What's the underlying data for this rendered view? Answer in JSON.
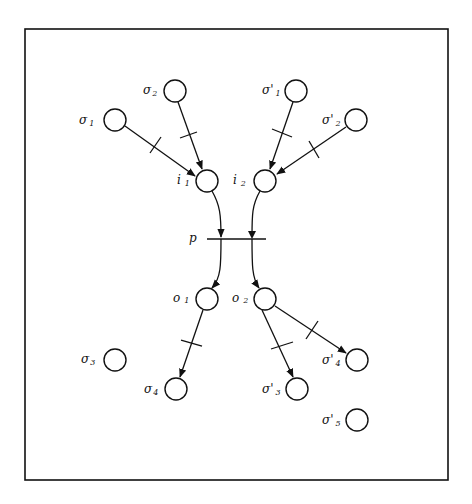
{
  "diagram": {
    "type": "petri-net",
    "frame": {
      "x": 25,
      "y": 29,
      "width": 423,
      "height": 451,
      "color": "#111111"
    },
    "places": [
      {
        "id": "sigma1",
        "label": "σ",
        "sub": "1",
        "cx": 115,
        "cy": 120
      },
      {
        "id": "sigma2",
        "label": "σ",
        "sub": "2",
        "cx": 175,
        "cy": 91
      },
      {
        "id": "sigmap1",
        "label": "σ'",
        "sub": "1",
        "cx": 296,
        "cy": 91
      },
      {
        "id": "sigmap2",
        "label": "σ'",
        "sub": "2",
        "cx": 356,
        "cy": 120
      },
      {
        "id": "i1",
        "label": "i",
        "sub": "1",
        "cx": 207,
        "cy": 181
      },
      {
        "id": "i2",
        "label": "i",
        "sub": "2",
        "cx": 265,
        "cy": 181
      },
      {
        "id": "o1",
        "label": "o",
        "sub": "1",
        "cx": 207,
        "cy": 299
      },
      {
        "id": "o2",
        "label": "o",
        "sub": "2",
        "cx": 265,
        "cy": 299
      },
      {
        "id": "sigma3",
        "label": "σ",
        "sub": "3",
        "cx": 115,
        "cy": 360
      },
      {
        "id": "sigma4",
        "label": "σ",
        "sub": "4",
        "cx": 176,
        "cy": 389
      },
      {
        "id": "sigmap3",
        "label": "σ'",
        "sub": "3",
        "cx": 297,
        "cy": 389
      },
      {
        "id": "sigmap4",
        "label": "σ'",
        "sub": "4",
        "cx": 357,
        "cy": 360
      },
      {
        "id": "sigmap5",
        "label": "σ'",
        "sub": "5",
        "cx": 357,
        "cy": 420
      }
    ],
    "transition": {
      "label": "p",
      "y": 239,
      "x1": 207,
      "x2": 266
    },
    "arcs": [
      {
        "from": "sigma1",
        "to": "i1",
        "has_transition_tick": true
      },
      {
        "from": "sigma2",
        "to": "i1",
        "has_transition_tick": true
      },
      {
        "from": "sigmap1",
        "to": "i2",
        "has_transition_tick": true
      },
      {
        "from": "sigmap2",
        "to": "i2",
        "has_transition_tick": true
      },
      {
        "from": "i1",
        "to": "p",
        "has_transition_tick": false
      },
      {
        "from": "i2",
        "to": "p",
        "has_transition_tick": false
      },
      {
        "from": "p",
        "to": "o1",
        "has_transition_tick": false
      },
      {
        "from": "p",
        "to": "o2",
        "has_transition_tick": false
      },
      {
        "from": "o1",
        "to": "sigma4",
        "has_transition_tick": true
      },
      {
        "from": "o2",
        "to": "sigmap3",
        "has_transition_tick": true
      },
      {
        "from": "o2",
        "to": "sigmap4",
        "has_transition_tick": true
      }
    ],
    "labels": {
      "sigma1": "σ",
      "sigma1_sub": "1",
      "sigma2": "σ",
      "sigma2_sub": "2",
      "sigmap1": "σ'",
      "sigmap1_sub": "1",
      "sigmap2": "σ'",
      "sigmap2_sub": "2",
      "i1": "i",
      "i1_sub": "1",
      "i2": "i",
      "i2_sub": "2",
      "p": "p",
      "o1": "o",
      "o1_sub": "1",
      "o2": "o",
      "o2_sub": "2",
      "sigma3": "σ",
      "sigma3_sub": "3",
      "sigma4": "σ",
      "sigma4_sub": "4",
      "sigmap3": "σ'",
      "sigmap3_sub": "3",
      "sigmap4": "σ'",
      "sigmap4_sub": "4",
      "sigmap5": "σ'",
      "sigmap5_sub": "5"
    }
  }
}
